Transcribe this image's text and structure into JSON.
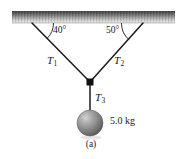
{
  "figure": {
    "caption": "(a)",
    "background_color": "#ffffff",
    "rope_color": "#1a1a1a",
    "ceiling_color_top": "#4a4a4a",
    "ceiling_color_bottom": "#e8e8e8",
    "ball_color": "#8a8a8a"
  },
  "ceiling": {
    "name": "ceiling-support"
  },
  "angles": {
    "left": "40°",
    "right": "50°"
  },
  "tensions": {
    "t1_symbol": "T",
    "t1_sub": "1",
    "t2_symbol": "T",
    "t2_sub": "2",
    "t3_symbol": "T",
    "t3_sub": "3"
  },
  "mass": {
    "label": "5.0 kg",
    "value": 5.0,
    "unit": "kg"
  },
  "geometry": {
    "ceiling_left_x": 12,
    "ceiling_right_x": 175,
    "ceiling_top_y": 11,
    "ceiling_bottom_y": 23,
    "anchor_left": [
      32,
      23
    ],
    "anchor_right": [
      143,
      23
    ],
    "knot": [
      90,
      82
    ],
    "ball_center": [
      90,
      123
    ],
    "ball_radius": 13
  }
}
